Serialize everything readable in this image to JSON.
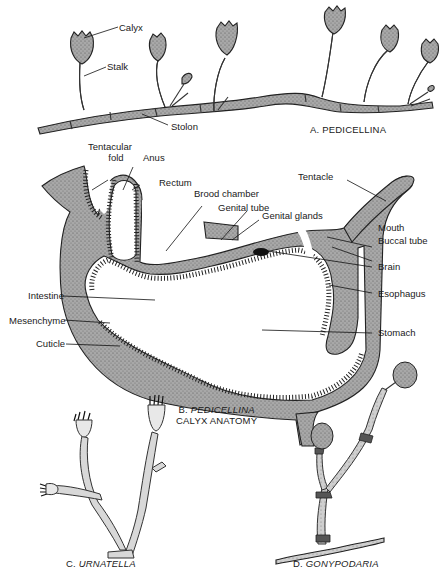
{
  "figure": {
    "panels": [
      {
        "id": "A",
        "caption_prefix": "A.",
        "caption_name": "PEDICELLINA",
        "caption_suffix": "",
        "labels": [
          "Calyx",
          "Stalk",
          "Stolon"
        ]
      },
      {
        "id": "B",
        "caption_prefix": "B.",
        "caption_name": "PEDICELLINA",
        "caption_suffix": "CALYX ANATOMY",
        "labels": [
          "Tentacular fold",
          "Anus",
          "Rectum",
          "Brood chamber",
          "Genital tube",
          "Genital glands",
          "Tentacle",
          "Mouth",
          "Buccal tube",
          "Brain",
          "Esophagus",
          "Intestine",
          "Mesenchyme",
          "Cuticle",
          "Stomach"
        ]
      },
      {
        "id": "C",
        "caption_prefix": "C.",
        "caption_name": "URNATELLA",
        "caption_suffix": ""
      },
      {
        "id": "D",
        "caption_prefix": "D.",
        "caption_name": "GONYPODARIA",
        "caption_suffix": ""
      }
    ]
  },
  "labels": {
    "calyx": "Calyx",
    "stalk": "Stalk",
    "stolon": "Stolon",
    "tentacular_fold_1": "Tentacular",
    "tentacular_fold_2": "fold",
    "anus": "Anus",
    "rectum": "Rectum",
    "brood_chamber": "Brood chamber",
    "genital_tube": "Genital tube",
    "genital_glands": "Genital glands",
    "tentacle": "Tentacle",
    "mouth": "Mouth",
    "buccal_tube": "Buccal tube",
    "brain": "Brain",
    "esophagus": "Esophagus",
    "intestine": "Intestine",
    "mesenchyme": "Mesenchyme",
    "cuticle": "Cuticle",
    "stomach": "Stomach"
  },
  "captions": {
    "a_prefix": "A.",
    "a_name": "PEDICELLINA",
    "b_prefix": "B.",
    "b_name": "PEDICELLINA",
    "b_line2": "CALYX ANATOMY",
    "c_prefix": "C.",
    "c_name": "URNATELLA",
    "d_prefix": "D.",
    "d_name": "GONYPODARIA"
  },
  "colors": {
    "tissue": "#8c8c8c",
    "outline": "#222222",
    "background": "#ffffff"
  }
}
